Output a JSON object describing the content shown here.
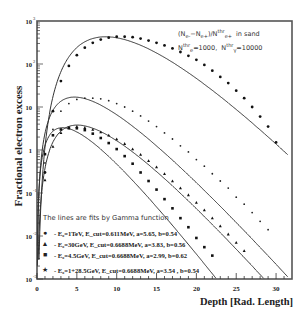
{
  "chart_data": {
    "type": "line",
    "title": "",
    "xlabel": "Depth [Rad. Length]",
    "ylabel": "Fractional electron excess",
    "xlim": [
      0,
      32
    ],
    "ylim": [
      0.001,
      1000
    ],
    "yscale": "log",
    "x_ticks": [
      0,
      5,
      10,
      15,
      20,
      25,
      30
    ],
    "y_ticks": [
      "10^-3",
      "10^-2",
      "10^-1",
      "1",
      "10",
      "10^2",
      "10^3"
    ],
    "annotation": [
      "(N_e- − N_e+)/N^thr_e+  in sand",
      "N^thr_e=1000,  N^thr_γ=10000"
    ],
    "fit_note": "The lines are fits by Gamma function",
    "legend_position": "lower-left",
    "series": [
      {
        "name": "E0=1TeV, Ecut=0.611MeV, a=5.65, b=0.54",
        "marker": "circle",
        "a": 5.65,
        "b": 0.54,
        "peak": 430,
        "points": [
          [
            1,
            0.3
          ],
          [
            2,
            8
          ],
          [
            3,
            40
          ],
          [
            4,
            90
          ],
          [
            5,
            160
          ],
          [
            6,
            240
          ],
          [
            7,
            310
          ],
          [
            8,
            370
          ],
          [
            9,
            410
          ],
          [
            10,
            430
          ],
          [
            11,
            430
          ],
          [
            12,
            420
          ],
          [
            13,
            390
          ],
          [
            14,
            350
          ],
          [
            15,
            310
          ],
          [
            16,
            270
          ],
          [
            17,
            230
          ],
          [
            18,
            190
          ],
          [
            19,
            155
          ],
          [
            20,
            125
          ],
          [
            21,
            95
          ],
          [
            22,
            70
          ],
          [
            23,
            50
          ],
          [
            24,
            36
          ],
          [
            25,
            24
          ],
          [
            26,
            16
          ],
          [
            27,
            10
          ],
          [
            28,
            6
          ],
          [
            29,
            3.5
          ],
          [
            30,
            1.5
          ]
        ]
      },
      {
        "name": "E0=1+28.5GeV, Ecut=0.6688MeV, a=3.54, b=0.54",
        "marker": "star",
        "a": 3.54,
        "b": 0.54,
        "peak": 17,
        "points": [
          [
            1,
            0.5
          ],
          [
            2,
            3
          ],
          [
            3,
            8
          ],
          [
            4,
            12
          ],
          [
            5,
            15
          ],
          [
            6,
            16
          ],
          [
            7,
            16
          ],
          [
            8,
            15.5
          ],
          [
            9,
            14
          ],
          [
            10,
            12
          ],
          [
            11,
            10
          ],
          [
            12,
            8
          ],
          [
            13,
            6.2
          ],
          [
            14,
            4.7
          ],
          [
            15,
            3.5
          ],
          [
            16,
            2.5
          ],
          [
            17,
            1.8
          ],
          [
            18,
            1.25
          ],
          [
            19,
            0.9
          ],
          [
            20,
            0.6
          ],
          [
            21,
            0.42
          ],
          [
            22,
            0.28
          ],
          [
            23,
            0.19
          ],
          [
            24,
            0.13
          ],
          [
            25,
            0.08
          ],
          [
            26,
            0.055
          ],
          [
            27,
            0.035
          ],
          [
            28,
            0.022
          ],
          [
            29,
            0.014
          ]
        ]
      },
      {
        "name": "E0=30GeV, Ecut=0.6688MeV, a=3.83, b=0.56",
        "marker": "triangle",
        "a": 3.83,
        "b": 0.56,
        "peak": 3.8,
        "points": [
          [
            1,
            0.2
          ],
          [
            2,
            1.2
          ],
          [
            3,
            2.5
          ],
          [
            4,
            3.2
          ],
          [
            5,
            3.5
          ],
          [
            6,
            3.3
          ],
          [
            7,
            3.0
          ],
          [
            8,
            2.6
          ],
          [
            9,
            2.2
          ],
          [
            10,
            1.8
          ],
          [
            11,
            1.4
          ],
          [
            12,
            1.05
          ],
          [
            13,
            0.78
          ],
          [
            14,
            0.56
          ],
          [
            15,
            0.4
          ],
          [
            16,
            0.28
          ],
          [
            17,
            0.19
          ],
          [
            18,
            0.13
          ],
          [
            19,
            0.09
          ],
          [
            20,
            0.06
          ],
          [
            21,
            0.04
          ],
          [
            22,
            0.026
          ],
          [
            23,
            0.017
          ],
          [
            24,
            0.011
          ],
          [
            25,
            0.007
          ],
          [
            26,
            0.0045
          ]
        ]
      },
      {
        "name": "E0=4.5GeV, Ecut=0.6688MeV, a=2.99, b=0.62",
        "marker": "square",
        "a": 2.99,
        "b": 0.62,
        "peak": 3.3,
        "points": [
          [
            1,
            0.8
          ],
          [
            2,
            2.2
          ],
          [
            3,
            3.0
          ],
          [
            4,
            3.3
          ],
          [
            5,
            3.2
          ],
          [
            6,
            2.9
          ],
          [
            7,
            2.4
          ],
          [
            8,
            1.9
          ],
          [
            9,
            1.45
          ],
          [
            10,
            1.05
          ],
          [
            11,
            0.72
          ],
          [
            12,
            0.48
          ],
          [
            13,
            0.3
          ],
          [
            14,
            0.19
          ],
          [
            15,
            0.12
          ],
          [
            16,
            0.072
          ],
          [
            17,
            0.044
          ],
          [
            18,
            0.026
          ],
          [
            19,
            0.016
          ],
          [
            20,
            0.009
          ],
          [
            21,
            0.0055
          ],
          [
            22,
            0.0035
          ]
        ]
      }
    ]
  },
  "labels": {
    "ylabel": "Fractional electron excess",
    "xlabel": "Depth [Rad. Length]",
    "fit_note": "The lines are fits by Gamma function"
  },
  "legend": [
    {
      "marker": "●",
      "text": "- E₀=1TeV, E_cut=0.611MeV, a=5.65, b=0.54"
    },
    {
      "marker": "▲",
      "text": "- E₀=30GeV, E_cut=0.6688MeV, a=3.83, b=0.56"
    },
    {
      "marker": "■",
      "text": "- E₀=4.5GeV, E_cut=0.6688MeV, a=2.99, b=0.62"
    },
    {
      "marker": "★",
      "text": "- E₀=1+28.5GeV, E_cut=0.6688MeV, a=3.54 , b=0.54"
    }
  ]
}
